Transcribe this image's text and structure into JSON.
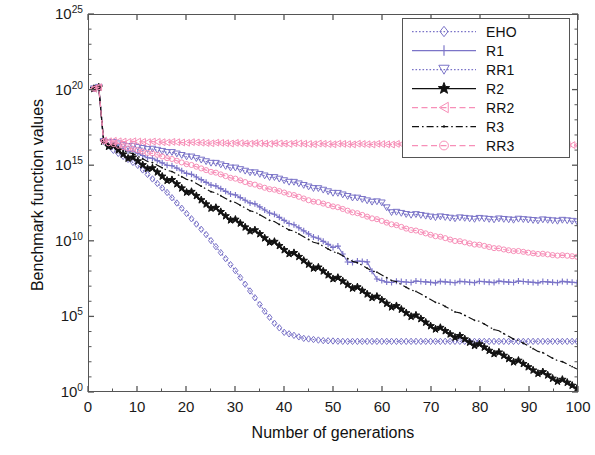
{
  "chart_data": {
    "type": "line",
    "title": "",
    "xlabel": "Number of generations",
    "ylabel": "Benchmark function values",
    "xlim": [
      0,
      100
    ],
    "ylim_exp": [
      0,
      25
    ],
    "yscale": "log",
    "grid": false,
    "legend_position": "top-right",
    "xticks": [
      "0",
      "10",
      "20",
      "30",
      "40",
      "50",
      "60",
      "70",
      "80",
      "90",
      "100"
    ],
    "xtick_values": [
      0,
      10,
      20,
      30,
      40,
      50,
      60,
      70,
      80,
      90,
      100
    ],
    "yticks": [
      "10^0",
      "10^5",
      "10^10",
      "10^15",
      "10^20",
      "10^25"
    ],
    "ytick_bases": [
      "10",
      "10",
      "10",
      "10",
      "10",
      "10"
    ],
    "ytick_exps": [
      "0",
      "5",
      "10",
      "15",
      "20",
      "25"
    ],
    "ytick_values": [
      0,
      5,
      10,
      15,
      20,
      25
    ],
    "series": [
      {
        "name": "EHO",
        "color": "#7b74c8",
        "marker": "diamond",
        "linestyle": "dotted",
        "x": [
          1,
          2,
          3,
          4,
          5,
          6,
          8,
          10,
          12,
          14,
          16,
          18,
          20,
          22,
          24,
          26,
          28,
          30,
          32,
          34,
          36,
          38,
          40,
          44,
          48,
          52,
          56,
          60,
          65,
          70,
          75,
          80,
          85,
          90,
          95,
          100
        ],
        "y_log10": [
          20.1,
          20.2,
          16.6,
          16.3,
          16.0,
          15.8,
          15.4,
          15.0,
          14.4,
          13.8,
          13.2,
          12.5,
          11.8,
          11.1,
          10.4,
          9.6,
          8.8,
          8.0,
          7.1,
          6.2,
          5.3,
          4.5,
          3.9,
          3.5,
          3.35,
          3.3,
          3.3,
          3.3,
          3.3,
          3.3,
          3.3,
          3.3,
          3.3,
          3.3,
          3.3,
          3.3
        ]
      },
      {
        "name": "R1",
        "color": "#7b74c8",
        "marker": "plus",
        "linestyle": "solid",
        "x": [
          1,
          2,
          3,
          4,
          6,
          8,
          10,
          14,
          18,
          22,
          26,
          30,
          34,
          38,
          42,
          46,
          50,
          51,
          53,
          55,
          57,
          59,
          61,
          63,
          66,
          70,
          75,
          80,
          85,
          90,
          95,
          100
        ],
        "y_log10": [
          20.1,
          20.2,
          16.6,
          16.4,
          16.2,
          16.0,
          15.8,
          15.3,
          14.8,
          14.2,
          13.6,
          13.0,
          12.4,
          11.7,
          11.0,
          10.3,
          9.6,
          9.6,
          8.6,
          8.6,
          8.6,
          7.4,
          7.25,
          7.25,
          7.25,
          7.25,
          7.25,
          7.25,
          7.25,
          7.25,
          7.25,
          7.25
        ]
      },
      {
        "name": "RR1",
        "color": "#7b74c8",
        "marker": "triangle-down",
        "linestyle": "dotted",
        "x": [
          1,
          2,
          3,
          5,
          8,
          12,
          16,
          20,
          25,
          30,
          35,
          40,
          45,
          50,
          55,
          58,
          60,
          62,
          65,
          70,
          75,
          80,
          85,
          90,
          95,
          100
        ],
        "y_log10": [
          20.1,
          20.2,
          16.6,
          16.5,
          16.3,
          16.1,
          15.9,
          15.6,
          15.2,
          14.8,
          14.4,
          14.0,
          13.6,
          13.2,
          12.8,
          12.6,
          12.5,
          11.9,
          11.75,
          11.6,
          11.5,
          11.45,
          11.4,
          11.38,
          11.35,
          11.3
        ]
      },
      {
        "name": "R2",
        "color": "#111111",
        "marker": "star",
        "linestyle": "solid",
        "x": [
          1,
          2,
          3,
          5,
          8,
          12,
          16,
          20,
          25,
          30,
          35,
          40,
          45,
          50,
          55,
          60,
          65,
          70,
          75,
          80,
          85,
          90,
          95,
          100
        ],
        "y_log10": [
          20.1,
          20.2,
          16.6,
          16.2,
          15.6,
          14.9,
          14.1,
          13.3,
          12.3,
          11.3,
          10.4,
          9.4,
          8.5,
          7.6,
          6.8,
          6.0,
          5.2,
          4.4,
          3.7,
          3.0,
          2.3,
          1.6,
          0.9,
          0.3
        ]
      },
      {
        "name": "RR2",
        "color": "#f78fb8",
        "marker": "triangle-left",
        "linestyle": "dashed",
        "x": [
          1,
          2,
          3,
          6,
          10,
          15,
          20,
          25,
          30,
          35,
          40,
          45,
          50,
          55,
          60,
          65,
          70,
          75,
          80,
          85,
          90,
          95,
          100
        ],
        "y_log10": [
          20.1,
          20.2,
          16.65,
          16.6,
          16.58,
          16.55,
          16.52,
          16.5,
          16.48,
          16.46,
          16.45,
          16.44,
          16.43,
          16.42,
          16.41,
          16.4,
          16.4,
          16.39,
          16.38,
          16.38,
          16.37,
          16.37,
          16.36
        ]
      },
      {
        "name": "R3",
        "color": "#111111",
        "marker": "dot",
        "linestyle": "dashdot",
        "x": [
          1,
          2,
          3,
          5,
          8,
          12,
          16,
          20,
          25,
          30,
          35,
          40,
          45,
          50,
          55,
          60,
          65,
          70,
          75,
          80,
          85,
          90,
          95,
          100
        ],
        "y_log10": [
          20.1,
          20.2,
          16.6,
          16.3,
          15.9,
          15.3,
          14.7,
          14.1,
          13.3,
          12.5,
          11.7,
          10.9,
          10.1,
          9.3,
          8.5,
          7.7,
          6.9,
          6.1,
          5.3,
          4.6,
          3.8,
          3.0,
          2.2,
          1.5
        ]
      },
      {
        "name": "RR3",
        "color": "#f78fb8",
        "marker": "circle",
        "linestyle": "dashed",
        "x": [
          1,
          2,
          3,
          6,
          10,
          14,
          18,
          22,
          26,
          30,
          35,
          40,
          45,
          50,
          55,
          60,
          65,
          70,
          75,
          80,
          85,
          90,
          95,
          100
        ],
        "y_log10": [
          20.1,
          20.2,
          16.6,
          16.3,
          16.0,
          15.7,
          15.3,
          14.9,
          14.5,
          14.1,
          13.6,
          13.2,
          12.7,
          12.3,
          11.8,
          11.3,
          10.8,
          10.4,
          10.0,
          9.7,
          9.4,
          9.2,
          9.05,
          8.95
        ]
      }
    ]
  },
  "axes": {
    "x_title": "Number of generations",
    "y_title": "Benchmark function values"
  },
  "legend": {
    "entries": [
      {
        "label": "EHO"
      },
      {
        "label": "R1"
      },
      {
        "label": "RR1"
      },
      {
        "label": "R2"
      },
      {
        "label": "RR2"
      },
      {
        "label": "R3"
      },
      {
        "label": "RR3"
      }
    ]
  }
}
